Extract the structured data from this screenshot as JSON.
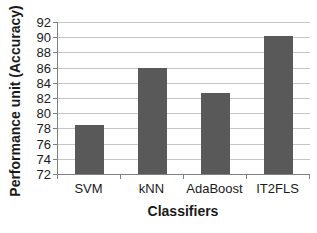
{
  "chart_data": {
    "type": "bar",
    "title": "",
    "categories": [
      "SVM",
      "kNN",
      "AdaBoost",
      "IT2FLS"
    ],
    "values": [
      78.5,
      86.0,
      82.6,
      90.2
    ],
    "xlabel": "Classifiers",
    "ylabel": "Performance unit (Accuracy)",
    "ylim": [
      72,
      92
    ],
    "yticks": [
      72,
      74,
      76,
      78,
      80,
      82,
      84,
      86,
      88,
      90,
      92
    ],
    "grid": "horizontal",
    "legend": false,
    "colors": {
      "bar": "#595959",
      "gridline": "#c6c6c6",
      "axis": "#808080",
      "text": "#1a1a1a",
      "background": "#ffffff"
    }
  }
}
